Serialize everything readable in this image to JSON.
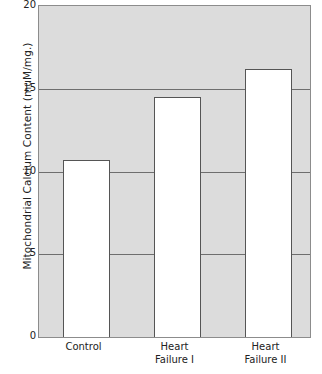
{
  "chart_data": {
    "type": "bar",
    "title": "",
    "xlabel": "",
    "ylabel": "Mitochondrial Calcium Content (muM/mg.)",
    "categories": [
      "Control",
      "Heart Failure I",
      "Heart Failure II"
    ],
    "category_lines": [
      [
        "Control"
      ],
      [
        "Heart",
        "Failure I"
      ],
      [
        "Heart",
        "Failure II"
      ]
    ],
    "values": [
      10.7,
      14.5,
      16.2
    ],
    "ylim": [
      0,
      20
    ],
    "yticks": [
      0,
      5,
      10,
      15,
      20
    ],
    "ytick_labels": [
      "0",
      "5",
      "10",
      "15",
      "20"
    ],
    "gridlines": [
      5,
      10,
      15
    ],
    "grid": true,
    "legend": "none",
    "colors": {
      "plot_background": "#dcdcdc",
      "bar_fill": "#ffffff",
      "bar_edge": "#555555",
      "gridline": "#6e6e6e",
      "axis": "#8c8c8c",
      "text": "#222222",
      "page_background": "#ffffff"
    }
  }
}
